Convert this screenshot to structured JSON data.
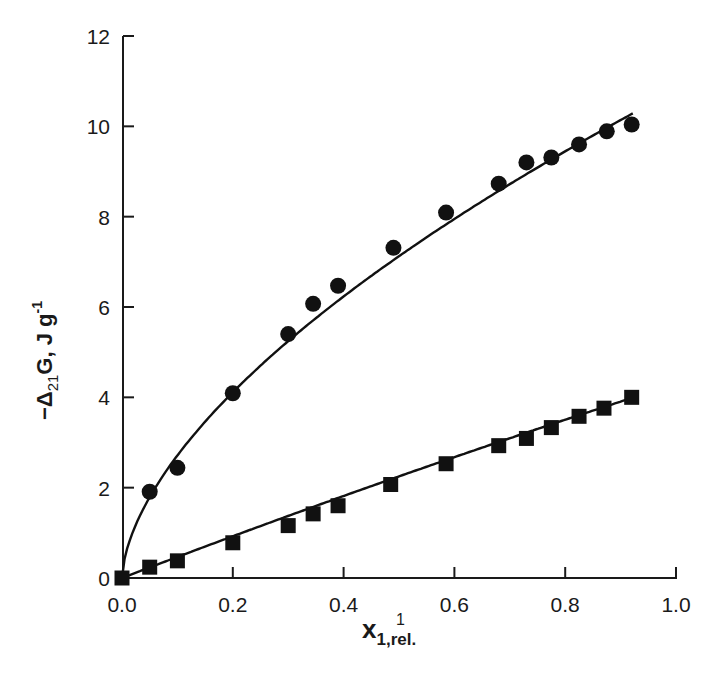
{
  "chart_data": {
    "type": "scatter",
    "title": "",
    "xlabel": "x1,rel.",
    "xlabel_parts": {
      "main": "x",
      "sub": "1,rel.",
      "stray": "1"
    },
    "ylabel": "−Δ21G, J g−1",
    "ylabel_parts": {
      "prefix": "−Δ",
      "sub": "21",
      "mid": "G, J g",
      "sup": "-1"
    },
    "xlim": [
      0.0,
      1.0
    ],
    "ylim": [
      0,
      12
    ],
    "xticks": [
      "0.0",
      "0.2",
      "0.4",
      "0.6",
      "0.8",
      "1.0"
    ],
    "yticks": [
      "0",
      "2",
      "4",
      "6",
      "8",
      "10",
      "12"
    ],
    "grid": false,
    "legend": null,
    "series": [
      {
        "name": "circles",
        "marker": "circle",
        "fit_line": true,
        "x": [
          0.0,
          0.05,
          0.1,
          0.2,
          0.3,
          0.345,
          0.39,
          0.49,
          0.585,
          0.68,
          0.73,
          0.775,
          0.825,
          0.875,
          0.92
        ],
        "y": [
          0.0,
          1.91,
          2.44,
          4.09,
          5.4,
          6.07,
          6.47,
          7.31,
          8.09,
          8.73,
          9.2,
          9.31,
          9.6,
          9.89,
          10.04
        ]
      },
      {
        "name": "squares",
        "marker": "square",
        "fit_line": true,
        "x": [
          0.0,
          0.05,
          0.1,
          0.2,
          0.3,
          0.345,
          0.39,
          0.485,
          0.585,
          0.68,
          0.73,
          0.775,
          0.825,
          0.87,
          0.92
        ],
        "y": [
          0.0,
          0.24,
          0.38,
          0.78,
          1.16,
          1.42,
          1.6,
          2.07,
          2.53,
          2.93,
          3.09,
          3.33,
          3.58,
          3.76,
          4.0
        ]
      }
    ],
    "fits": {
      "circles": {
        "form": "a*x^b",
        "a": 10.8,
        "b": 0.6
      },
      "squares": {
        "form": "a*x + c*x^2",
        "a": 4.7,
        "c": -0.4
      }
    }
  }
}
